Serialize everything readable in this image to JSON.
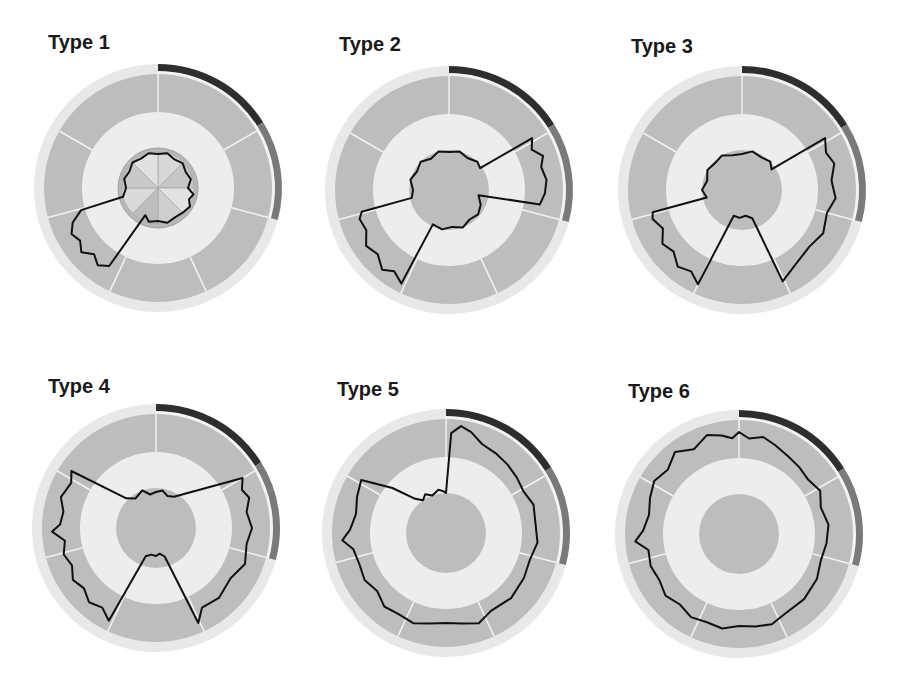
{
  "figure": {
    "panels": [
      {
        "title": "Type 1",
        "title_pos": [
          48,
          31
        ],
        "center": [
          158,
          188
        ]
      },
      {
        "title": "Type 2",
        "title_pos": [
          339,
          33
        ],
        "center": [
          449,
          190
        ]
      },
      {
        "title": "Type 3",
        "title_pos": [
          631,
          35
        ],
        "center": [
          742,
          190
        ]
      },
      {
        "title": "Type 4",
        "title_pos": [
          48,
          375
        ],
        "center": [
          156,
          528
        ]
      },
      {
        "title": "Type 5",
        "title_pos": [
          337,
          378
        ],
        "center": [
          446,
          533
        ]
      },
      {
        "title": "Type 6",
        "title_pos": [
          628,
          380
        ],
        "center": [
          739,
          534
        ]
      }
    ]
  },
  "chart_data": {
    "type": "radial-profile",
    "geometry": {
      "inner_disc_r": 40,
      "ring_inner_r": 76,
      "ring_outer_r": 114,
      "band_inner_r": 117,
      "band_outer_r": 124,
      "ring_dividers_deg": [
        0,
        60,
        105,
        155,
        205,
        255,
        300
      ],
      "band_segments": [
        {
          "from": 0,
          "to": 58,
          "color": "#2e2e2e"
        },
        {
          "from": 58,
          "to": 105,
          "color": "#7a7a7a"
        },
        {
          "from": 105,
          "to": 330,
          "color": "#e6e6e6"
        }
      ]
    },
    "colors": {
      "ring": "#bdbdbd",
      "disc": "#bdbdbd",
      "divider": "#f2f2f2",
      "trace": "#111111",
      "title": "#1a1a1a"
    },
    "series": [
      {
        "name": "Type 1",
        "disc_style": "pie",
        "trace": [
          [
            0,
            34
          ],
          [
            15,
            36
          ],
          [
            30,
            33
          ],
          [
            45,
            35
          ],
          [
            60,
            32
          ],
          [
            75,
            34
          ],
          [
            90,
            30
          ],
          [
            100,
            36
          ],
          [
            110,
            33
          ],
          [
            120,
            37
          ],
          [
            135,
            35
          ],
          [
            150,
            34
          ],
          [
            165,
            36
          ],
          [
            180,
            33
          ],
          [
            195,
            35
          ],
          [
            205,
            30
          ],
          [
            212,
            92
          ],
          [
            218,
            98
          ],
          [
            224,
            92
          ],
          [
            230,
            100
          ],
          [
            236,
            94
          ],
          [
            242,
            98
          ],
          [
            248,
            92
          ],
          [
            254,
            80
          ],
          [
            256,
            36
          ],
          [
            270,
            32
          ],
          [
            285,
            35
          ],
          [
            300,
            33
          ],
          [
            315,
            36
          ],
          [
            330,
            34
          ],
          [
            345,
            36
          ]
        ]
      },
      {
        "name": "Type 2",
        "disc_style": "plain",
        "trace": [
          [
            0,
            38
          ],
          [
            15,
            40
          ],
          [
            30,
            37
          ],
          [
            45,
            40
          ],
          [
            55,
            38
          ],
          [
            58,
            98
          ],
          [
            64,
            92
          ],
          [
            70,
            100
          ],
          [
            76,
            95
          ],
          [
            84,
            98
          ],
          [
            92,
            96
          ],
          [
            99,
            92
          ],
          [
            100,
            30
          ],
          [
            115,
            35
          ],
          [
            130,
            38
          ],
          [
            145,
            36
          ],
          [
            160,
            40
          ],
          [
            175,
            37
          ],
          [
            190,
            40
          ],
          [
            205,
            38
          ],
          [
            207,
            105
          ],
          [
            214,
            98
          ],
          [
            220,
            104
          ],
          [
            228,
            96
          ],
          [
            236,
            100
          ],
          [
            244,
            92
          ],
          [
            252,
            94
          ],
          [
            256,
            90
          ],
          [
            258,
            38
          ],
          [
            270,
            36
          ],
          [
            285,
            40
          ],
          [
            300,
            37
          ],
          [
            315,
            40
          ],
          [
            330,
            36
          ],
          [
            345,
            40
          ]
        ]
      },
      {
        "name": "Type 3",
        "disc_style": "plain",
        "trace": [
          [
            0,
            36
          ],
          [
            15,
            40
          ],
          [
            30,
            38
          ],
          [
            45,
            40
          ],
          [
            55,
            36
          ],
          [
            58,
            98
          ],
          [
            66,
            92
          ],
          [
            74,
            96
          ],
          [
            84,
            90
          ],
          [
            95,
            94
          ],
          [
            105,
            88
          ],
          [
            118,
            92
          ],
          [
            130,
            88
          ],
          [
            145,
            92
          ],
          [
            156,
            100
          ],
          [
            160,
            30
          ],
          [
            172,
            26
          ],
          [
            185,
            28
          ],
          [
            198,
            27
          ],
          [
            205,
            104
          ],
          [
            212,
            96
          ],
          [
            220,
            100
          ],
          [
            228,
            92
          ],
          [
            236,
            96
          ],
          [
            244,
            88
          ],
          [
            252,
            94
          ],
          [
            256,
            92
          ],
          [
            258,
            36
          ],
          [
            270,
            40
          ],
          [
            285,
            36
          ],
          [
            300,
            40
          ],
          [
            315,
            38
          ],
          [
            330,
            40
          ],
          [
            345,
            36
          ]
        ]
      },
      {
        "name": "Type 4",
        "disc_style": "plain",
        "trace": [
          [
            0,
            36
          ],
          [
            10,
            38
          ],
          [
            20,
            34
          ],
          [
            30,
            36
          ],
          [
            60,
            100
          ],
          [
            66,
            94
          ],
          [
            72,
            98
          ],
          [
            80,
            92
          ],
          [
            90,
            96
          ],
          [
            100,
            92
          ],
          [
            112,
            96
          ],
          [
            124,
            90
          ],
          [
            138,
            94
          ],
          [
            150,
            92
          ],
          [
            156,
            104
          ],
          [
            163,
            30
          ],
          [
            172,
            26
          ],
          [
            180,
            28
          ],
          [
            190,
            27
          ],
          [
            200,
            30
          ],
          [
            207,
            104
          ],
          [
            214,
            96
          ],
          [
            222,
            100
          ],
          [
            230,
            94
          ],
          [
            238,
            98
          ],
          [
            246,
            92
          ],
          [
            254,
            96
          ],
          [
            262,
            92
          ],
          [
            268,
            104
          ],
          [
            272,
            96
          ],
          [
            280,
            94
          ],
          [
            288,
            100
          ],
          [
            298,
            96
          ],
          [
            304,
            102
          ],
          [
            315,
            42
          ],
          [
            325,
            36
          ],
          [
            340,
            40
          ],
          [
            350,
            34
          ]
        ]
      },
      {
        "name": "Type 5",
        "disc_style": "plain",
        "trace": [
          [
            0,
            40
          ],
          [
            3,
            100
          ],
          [
            8,
            108
          ],
          [
            14,
            104
          ],
          [
            22,
            96
          ],
          [
            32,
            94
          ],
          [
            42,
            92
          ],
          [
            52,
            90
          ],
          [
            62,
            88
          ],
          [
            72,
            92
          ],
          [
            84,
            90
          ],
          [
            96,
            92
          ],
          [
            108,
            88
          ],
          [
            120,
            90
          ],
          [
            135,
            92
          ],
          [
            150,
            90
          ],
          [
            160,
            96
          ],
          [
            170,
            92
          ],
          [
            180,
            90
          ],
          [
            190,
            92
          ],
          [
            200,
            96
          ],
          [
            210,
            94
          ],
          [
            220,
            96
          ],
          [
            230,
            90
          ],
          [
            240,
            94
          ],
          [
            250,
            92
          ],
          [
            260,
            94
          ],
          [
            266,
            104
          ],
          [
            272,
            96
          ],
          [
            282,
            92
          ],
          [
            292,
            96
          ],
          [
            302,
            100
          ],
          [
            310,
            70
          ],
          [
            318,
            46
          ],
          [
            325,
            40
          ],
          [
            332,
            44
          ],
          [
            340,
            40
          ],
          [
            350,
            44
          ],
          [
            356,
            42
          ]
        ]
      },
      {
        "name": "Type 6",
        "disc_style": "plain",
        "trace": [
          [
            0,
            102
          ],
          [
            6,
            96
          ],
          [
            14,
            100
          ],
          [
            22,
            96
          ],
          [
            32,
            92
          ],
          [
            42,
            90
          ],
          [
            52,
            88
          ],
          [
            62,
            92
          ],
          [
            72,
            86
          ],
          [
            84,
            90
          ],
          [
            96,
            88
          ],
          [
            108,
            86
          ],
          [
            120,
            90
          ],
          [
            135,
            92
          ],
          [
            150,
            92
          ],
          [
            160,
            96
          ],
          [
            170,
            94
          ],
          [
            180,
            92
          ],
          [
            190,
            96
          ],
          [
            200,
            94
          ],
          [
            210,
            96
          ],
          [
            220,
            92
          ],
          [
            230,
            96
          ],
          [
            240,
            92
          ],
          [
            250,
            94
          ],
          [
            260,
            92
          ],
          [
            266,
            104
          ],
          [
            272,
            96
          ],
          [
            282,
            92
          ],
          [
            292,
            96
          ],
          [
            302,
            100
          ],
          [
            312,
            96
          ],
          [
            322,
            104
          ],
          [
            332,
            96
          ],
          [
            342,
            104
          ],
          [
            350,
            100
          ],
          [
            356,
            96
          ]
        ]
      }
    ]
  }
}
